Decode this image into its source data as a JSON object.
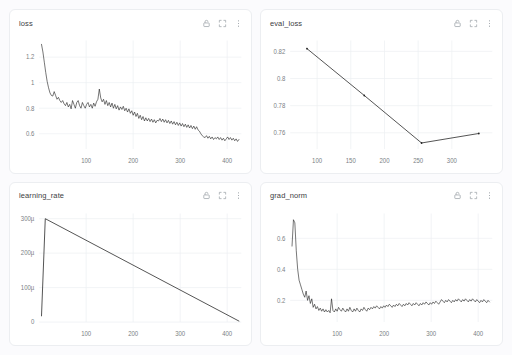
{
  "page": {
    "background": "#fbfbfd",
    "card_background": "#ffffff",
    "line_color": "#1f1f1f",
    "grid_color": "#edeff2",
    "tick_color": "#7b8084"
  },
  "icons": {
    "lock": "lock-icon",
    "expand": "expand-icon",
    "menu": "more-vertical-icon"
  },
  "panels": [
    {
      "id": "loss",
      "title": "loss",
      "actions": {
        "lock_label": "Lock",
        "expand_label": "Expand",
        "menu_label": "More options"
      }
    },
    {
      "id": "eval_loss",
      "title": "eval_loss",
      "actions": {
        "lock_label": "Lock",
        "expand_label": "Expand",
        "menu_label": "More options"
      }
    },
    {
      "id": "learning_rate",
      "title": "learning_rate",
      "actions": {
        "lock_label": "Lock",
        "expand_label": "Expand",
        "menu_label": "More options"
      }
    },
    {
      "id": "grad_norm",
      "title": "grad_norm",
      "actions": {
        "lock_label": "Lock",
        "expand_label": "Expand",
        "menu_label": "More options"
      }
    }
  ],
  "chart_data": [
    {
      "type": "line",
      "id": "loss",
      "title": "loss",
      "xlabel": "",
      "ylabel": "",
      "xlim": [
        0,
        430
      ],
      "ylim": [
        0.48,
        1.33
      ],
      "xticks": [
        100,
        200,
        300,
        400
      ],
      "yticks": [
        1.2,
        1,
        0.8,
        0.6
      ],
      "ytick_labels": [
        "1.2",
        "1",
        "0.8",
        "0.6"
      ],
      "grid": true,
      "legend": false,
      "x": [
        5,
        8,
        11,
        14,
        17,
        20,
        23,
        26,
        29,
        32,
        35,
        38,
        41,
        44,
        47,
        50,
        53,
        56,
        59,
        62,
        65,
        68,
        71,
        74,
        77,
        80,
        83,
        86,
        89,
        92,
        95,
        98,
        101,
        104,
        107,
        110,
        113,
        116,
        119,
        122,
        125,
        128,
        131,
        134,
        137,
        140,
        143,
        146,
        149,
        152,
        155,
        158,
        161,
        164,
        167,
        170,
        173,
        176,
        179,
        182,
        185,
        188,
        191,
        194,
        197,
        200,
        203,
        206,
        209,
        212,
        215,
        218,
        221,
        224,
        227,
        230,
        233,
        236,
        239,
        242,
        245,
        248,
        251,
        254,
        257,
        260,
        263,
        266,
        269,
        272,
        275,
        278,
        281,
        284,
        287,
        290,
        293,
        296,
        299,
        302,
        305,
        308,
        311,
        314,
        317,
        320,
        323,
        326,
        329,
        332,
        335,
        338,
        341,
        344,
        347,
        350,
        353,
        356,
        359,
        362,
        365,
        368,
        371,
        374,
        377,
        380,
        383,
        386,
        389,
        392,
        395,
        398,
        401,
        404,
        407,
        410,
        413,
        416,
        419,
        422,
        425
      ],
      "y": [
        1.3,
        1.24,
        1.16,
        1.08,
        1.01,
        0.96,
        0.92,
        0.9,
        0.895,
        0.93,
        0.9,
        0.87,
        0.885,
        0.86,
        0.845,
        0.86,
        0.835,
        0.82,
        0.845,
        0.81,
        0.83,
        0.795,
        0.86,
        0.83,
        0.8,
        0.845,
        0.86,
        0.82,
        0.8,
        0.845,
        0.82,
        0.8,
        0.83,
        0.845,
        0.81,
        0.83,
        0.8,
        0.84,
        0.815,
        0.85,
        0.87,
        0.95,
        0.88,
        0.85,
        0.87,
        0.83,
        0.86,
        0.82,
        0.845,
        0.81,
        0.84,
        0.8,
        0.83,
        0.795,
        0.82,
        0.785,
        0.81,
        0.79,
        0.815,
        0.78,
        0.8,
        0.77,
        0.795,
        0.76,
        0.78,
        0.745,
        0.77,
        0.735,
        0.76,
        0.72,
        0.745,
        0.71,
        0.735,
        0.7,
        0.725,
        0.7,
        0.72,
        0.695,
        0.715,
        0.69,
        0.71,
        0.685,
        0.705,
        0.7,
        0.72,
        0.695,
        0.715,
        0.69,
        0.71,
        0.685,
        0.705,
        0.68,
        0.7,
        0.675,
        0.695,
        0.67,
        0.69,
        0.665,
        0.685,
        0.66,
        0.68,
        0.655,
        0.675,
        0.65,
        0.67,
        0.645,
        0.665,
        0.64,
        0.66,
        0.635,
        0.655,
        0.63,
        0.62,
        0.6,
        0.585,
        0.575,
        0.57,
        0.585,
        0.565,
        0.58,
        0.56,
        0.575,
        0.555,
        0.57,
        0.56,
        0.575,
        0.555,
        0.57,
        0.55,
        0.565,
        0.545,
        0.56,
        0.575,
        0.555,
        0.57,
        0.55,
        0.565,
        0.545,
        0.56,
        0.54,
        0.555,
        0.535,
        0.56
      ]
    },
    {
      "type": "line",
      "id": "eval_loss",
      "title": "eval_loss",
      "xlabel": "",
      "ylabel": "",
      "xlim": [
        60,
        360
      ],
      "ylim": [
        0.748,
        0.828
      ],
      "xticks": [
        100,
        150,
        200,
        250,
        300
      ],
      "yticks": [
        0.82,
        0.8,
        0.78,
        0.76
      ],
      "ytick_labels": [
        "0.82",
        "0.8",
        "0.78",
        "0.76"
      ],
      "grid": true,
      "legend": false,
      "x": [
        85,
        170,
        255,
        340
      ],
      "y": [
        0.822,
        0.7875,
        0.7525,
        0.7595
      ],
      "markers": true
    },
    {
      "type": "line",
      "id": "learning_rate",
      "title": "learning_rate",
      "xlabel": "",
      "ylabel": "",
      "xlim": [
        0,
        430
      ],
      "ylim": [
        0,
        315
      ],
      "yunit": "µ",
      "xticks": [
        100,
        200,
        300,
        400
      ],
      "yticks": [
        300,
        200,
        100,
        0
      ],
      "ytick_labels": [
        "300µ",
        "200µ",
        "100µ",
        "0"
      ],
      "grid": true,
      "legend": false,
      "x": [
        5,
        13,
        425
      ],
      "y": [
        18,
        300,
        3
      ]
    },
    {
      "type": "line",
      "id": "grad_norm",
      "title": "grad_norm",
      "xlabel": "",
      "ylabel": "",
      "xlim": [
        0,
        430
      ],
      "ylim": [
        0.06,
        0.76
      ],
      "xticks": [
        100,
        200,
        300,
        400
      ],
      "yticks": [
        0.6,
        0.4,
        0.2
      ],
      "ytick_labels": [
        "0.6",
        "0.4",
        "0.2"
      ],
      "grid": true,
      "legend": false,
      "x": [
        4,
        7,
        10,
        13,
        16,
        19,
        22,
        25,
        28,
        31,
        34,
        37,
        40,
        43,
        46,
        49,
        52,
        55,
        58,
        61,
        64,
        67,
        70,
        73,
        76,
        79,
        82,
        85,
        88,
        91,
        94,
        97,
        100,
        103,
        106,
        109,
        112,
        115,
        118,
        121,
        124,
        127,
        130,
        133,
        136,
        139,
        142,
        145,
        148,
        151,
        154,
        157,
        160,
        163,
        166,
        169,
        172,
        175,
        178,
        181,
        184,
        187,
        190,
        193,
        196,
        199,
        202,
        205,
        208,
        211,
        214,
        217,
        220,
        223,
        226,
        229,
        232,
        235,
        238,
        241,
        244,
        247,
        250,
        253,
        256,
        259,
        262,
        265,
        268,
        271,
        274,
        277,
        280,
        283,
        286,
        289,
        292,
        295,
        298,
        301,
        304,
        307,
        310,
        313,
        316,
        319,
        322,
        325,
        328,
        331,
        334,
        337,
        340,
        343,
        346,
        349,
        352,
        355,
        358,
        361,
        364,
        367,
        370,
        373,
        376,
        379,
        382,
        385,
        388,
        391,
        394,
        397,
        400,
        403,
        406,
        409,
        412,
        415,
        418,
        421,
        424
      ],
      "y": [
        0.55,
        0.72,
        0.7,
        0.52,
        0.4,
        0.33,
        0.3,
        0.27,
        0.24,
        0.22,
        0.26,
        0.2,
        0.23,
        0.18,
        0.21,
        0.155,
        0.175,
        0.145,
        0.16,
        0.135,
        0.15,
        0.13,
        0.145,
        0.125,
        0.14,
        0.125,
        0.135,
        0.12,
        0.21,
        0.135,
        0.125,
        0.145,
        0.13,
        0.155,
        0.14,
        0.13,
        0.15,
        0.135,
        0.125,
        0.145,
        0.13,
        0.155,
        0.135,
        0.125,
        0.145,
        0.13,
        0.15,
        0.135,
        0.125,
        0.145,
        0.135,
        0.155,
        0.14,
        0.13,
        0.15,
        0.14,
        0.155,
        0.145,
        0.16,
        0.15,
        0.165,
        0.155,
        0.145,
        0.16,
        0.15,
        0.165,
        0.155,
        0.17,
        0.16,
        0.175,
        0.165,
        0.155,
        0.17,
        0.16,
        0.175,
        0.165,
        0.18,
        0.17,
        0.16,
        0.175,
        0.165,
        0.18,
        0.17,
        0.185,
        0.175,
        0.165,
        0.18,
        0.17,
        0.185,
        0.175,
        0.165,
        0.18,
        0.17,
        0.185,
        0.175,
        0.19,
        0.18,
        0.17,
        0.185,
        0.175,
        0.19,
        0.18,
        0.195,
        0.185,
        0.175,
        0.19,
        0.205,
        0.195,
        0.185,
        0.2,
        0.19,
        0.205,
        0.195,
        0.185,
        0.2,
        0.19,
        0.205,
        0.195,
        0.21,
        0.2,
        0.19,
        0.205,
        0.195,
        0.21,
        0.2,
        0.19,
        0.205,
        0.195,
        0.21,
        0.2,
        0.19,
        0.205,
        0.195,
        0.185,
        0.2,
        0.19,
        0.205,
        0.195,
        0.185,
        0.2,
        0.19,
        0.18
      ]
    }
  ]
}
